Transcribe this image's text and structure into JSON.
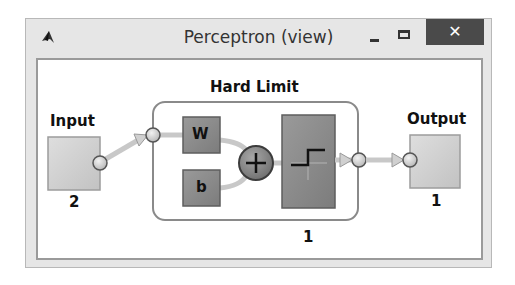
{
  "window": {
    "title": "Perceptron (view)",
    "icon": "matlab-logo-icon",
    "controls": {
      "minimize": "minimize-icon",
      "maximize": "maximize-icon",
      "close_label": "✕"
    }
  },
  "diagram": {
    "input": {
      "label": "Input",
      "size": "2"
    },
    "layer": {
      "label": "Hard Limit",
      "size": "1",
      "weight_label": "W",
      "bias_label": "b",
      "transfer": "hardlim-step-icon",
      "sum": "+"
    },
    "output": {
      "label": "Output",
      "size": "1"
    }
  },
  "colors": {
    "close_button": "#4a4a4a",
    "light_block": "#cfcfcf",
    "dark_block": "#8c8c8c",
    "connector": "#c8c8c8"
  }
}
